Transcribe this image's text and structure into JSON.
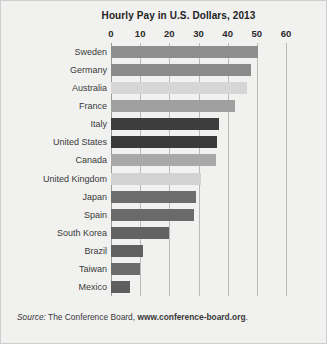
{
  "chart_data": {
    "type": "bar",
    "orientation": "horizontal",
    "title": "Hourly Pay in U.S. Dollars, 2013",
    "xlabel": "",
    "ylabel": "",
    "xlim": [
      0,
      60
    ],
    "xticks": [
      0,
      10,
      20,
      30,
      40,
      50,
      60
    ],
    "grid": true,
    "legend": "none",
    "categories": [
      "Sweden",
      "Germany",
      "Australia",
      "France",
      "Italy",
      "United States",
      "Canada",
      "United Kingdom",
      "Japan",
      "Spain",
      "South Korea",
      "Brazil",
      "Taiwan",
      "Mexico"
    ],
    "values": [
      50.5,
      48,
      46.5,
      42.5,
      37,
      36.5,
      36,
      31,
      29,
      28.5,
      20,
      11,
      10,
      6.5
    ],
    "bar_colors": [
      "#8d8d8d",
      "#8a8a8a",
      "#d6d6d6",
      "#a0a0a0",
      "#3d3d3d",
      "#3a3a3a",
      "#a9a9a9",
      "#d2d2d2",
      "#6d6d6d",
      "#6a6a6a",
      "#636363",
      "#606060",
      "#6b6b6b",
      "#5e5e5e"
    ]
  },
  "source": {
    "label": "Source:",
    "body": " The Conference Board, ",
    "url": "www.conference-board.org",
    "period": "."
  },
  "colors": {
    "background": "#f1f1f0",
    "gridline": "#b9b9b9",
    "text": "#2b2b2b"
  }
}
